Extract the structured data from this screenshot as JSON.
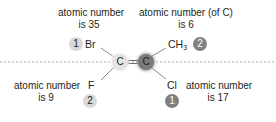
{
  "colors": {
    "light_badge": "#d9d9d9",
    "dark_badge": "#808080",
    "carbon_light": "#e3e3e3",
    "carbon_dark": "#7a7a7a",
    "dashed_line": "#9a9a9a",
    "bond": "#6d6d6d"
  },
  "left_carbon": {
    "symbol": "C",
    "shade": "light"
  },
  "right_carbon": {
    "symbol": "C",
    "shade": "dark"
  },
  "substituents": {
    "top_left": {
      "symbol": "Br",
      "priority": "1",
      "label_line1": "atomic number",
      "label_line2": "is 35",
      "shade": "light"
    },
    "top_right": {
      "symbol": "CH",
      "subscript": "3",
      "priority": "2",
      "label_line1": "atomic number (of C)",
      "label_line2": "is 6",
      "shade": "dark"
    },
    "bottom_left": {
      "symbol": "F",
      "priority": "2",
      "label_line1": "atomic number",
      "label_line2": "is 9",
      "shade": "light"
    },
    "bottom_right": {
      "symbol": "Cl",
      "priority": "1",
      "label_line1": "atomic number",
      "label_line2": "is 17",
      "shade": "dark"
    }
  }
}
